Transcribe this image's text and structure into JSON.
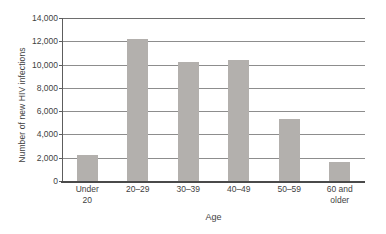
{
  "chart_data": {
    "type": "bar",
    "title": "",
    "xlabel": "Age",
    "ylabel": "Number of new HIV infections",
    "categories": [
      "Under 20",
      "20–29",
      "30–39",
      "40–49",
      "50–59",
      "60 and older"
    ],
    "category_lines": [
      [
        "Under",
        "20"
      ],
      [
        "20–29",
        ""
      ],
      [
        "30–39",
        ""
      ],
      [
        "40–49",
        ""
      ],
      [
        "50–59",
        ""
      ],
      [
        "60 and",
        "older"
      ]
    ],
    "values": [
      2200,
      12200,
      10250,
      10400,
      5300,
      1600
    ],
    "ylim": [
      0,
      14000
    ],
    "ytick_values": [
      0,
      2000,
      4000,
      6000,
      8000,
      10000,
      12000,
      14000
    ],
    "ytick_labels": [
      "0",
      "2,000",
      "4,000",
      "6,000",
      "8,000",
      "10,000",
      "12,000",
      "14,000"
    ],
    "grid": true,
    "legend": "none",
    "bar_color": "#b3b0ad",
    "axis_color": "#4a4a4a",
    "grid_color": "#8d8d8d",
    "background": "#ffffff"
  }
}
